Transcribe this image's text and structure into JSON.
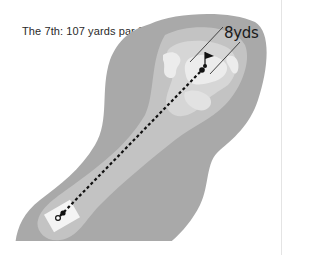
{
  "hole": {
    "title": "The 7th: 107 yards par 3",
    "number": "7th",
    "length_yards": 107,
    "par": 3
  },
  "annotation": {
    "distance_label": "8yds"
  },
  "colors": {
    "rough": "#a9a9a9",
    "fairway": "#c3c3c3",
    "green_surround": "#d6d6d6",
    "green": "#ececec",
    "tee_box": "#f4f4f4",
    "line": "#111111",
    "background": "#ffffff"
  },
  "icons": {
    "flag": "flag-icon",
    "ball_marker": "pin-dot-icon",
    "tee_marker": "tee-marker-icon"
  }
}
